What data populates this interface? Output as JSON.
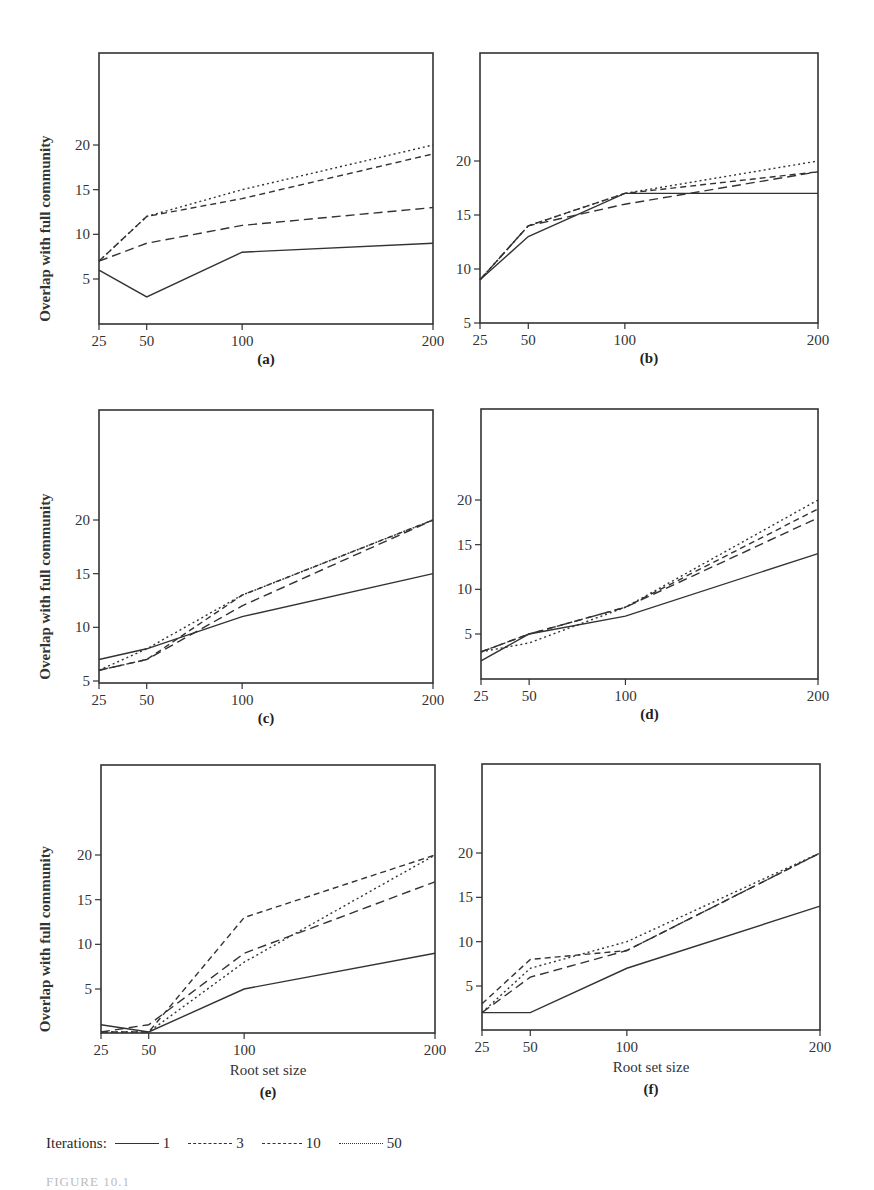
{
  "chart_data": [
    {
      "panel": "(a)",
      "type": "line",
      "x": [
        25,
        50,
        100,
        200
      ],
      "ylabel": "Overlap with full community",
      "xlabel": "",
      "yticks": [
        5,
        10,
        15,
        20
      ],
      "ylim": [
        0,
        30
      ],
      "series": [
        {
          "name": "1",
          "values": [
            6,
            3,
            8,
            9
          ]
        },
        {
          "name": "3",
          "values": [
            7,
            9,
            11,
            13
          ]
        },
        {
          "name": "10",
          "values": [
            7,
            12,
            14,
            19
          ]
        },
        {
          "name": "50",
          "values": [
            7,
            12,
            15,
            20
          ]
        }
      ]
    },
    {
      "panel": "(b)",
      "type": "line",
      "x": [
        25,
        50,
        100,
        200
      ],
      "ylabel": "",
      "xlabel": "",
      "yticks": [
        5,
        10,
        15,
        20
      ],
      "ylim": [
        5,
        30
      ],
      "series": [
        {
          "name": "1",
          "values": [
            9,
            13,
            17,
            17
          ]
        },
        {
          "name": "3",
          "values": [
            9,
            14,
            16,
            19
          ]
        },
        {
          "name": "10",
          "values": [
            9,
            14,
            17,
            19
          ]
        },
        {
          "name": "50",
          "values": [
            9,
            14,
            17,
            20
          ]
        }
      ]
    },
    {
      "panel": "(c)",
      "type": "line",
      "x": [
        25,
        50,
        100,
        200
      ],
      "ylabel": "Overlap with full community",
      "xlabel": "",
      "yticks": [
        5,
        10,
        15,
        20
      ],
      "ylim": [
        5,
        30
      ],
      "series": [
        {
          "name": "1",
          "values": [
            7,
            8,
            11,
            15
          ]
        },
        {
          "name": "3",
          "values": [
            6,
            7,
            12,
            20
          ]
        },
        {
          "name": "10",
          "values": [
            6,
            7,
            13,
            20
          ]
        },
        {
          "name": "50",
          "values": [
            6,
            8,
            13,
            20
          ]
        }
      ]
    },
    {
      "panel": "(d)",
      "type": "line",
      "x": [
        25,
        50,
        100,
        200
      ],
      "ylabel": "",
      "xlabel": "",
      "yticks": [
        5,
        10,
        15,
        20
      ],
      "ylim": [
        0,
        30
      ],
      "series": [
        {
          "name": "1",
          "values": [
            2,
            5,
            7,
            14
          ]
        },
        {
          "name": "3",
          "values": [
            3,
            5,
            8,
            18
          ]
        },
        {
          "name": "10",
          "values": [
            3,
            5,
            8,
            19
          ]
        },
        {
          "name": "50",
          "values": [
            3,
            4,
            8,
            20
          ]
        }
      ]
    },
    {
      "panel": "(e)",
      "type": "line",
      "x": [
        25,
        50,
        100,
        200
      ],
      "ylabel": "Overlap with full community",
      "xlabel": "Root set size",
      "yticks": [
        5,
        10,
        15,
        20
      ],
      "ylim": [
        0,
        30
      ],
      "series": [
        {
          "name": "1",
          "values": [
            1,
            0,
            5,
            9
          ]
        },
        {
          "name": "3",
          "values": [
            0,
            1,
            9,
            17
          ]
        },
        {
          "name": "10",
          "values": [
            0,
            0,
            13,
            20
          ]
        },
        {
          "name": "50",
          "values": [
            0,
            0,
            8,
            20
          ]
        }
      ]
    },
    {
      "panel": "(f)",
      "type": "line",
      "x": [
        25,
        50,
        100,
        200
      ],
      "ylabel": "",
      "xlabel": "Root set size",
      "yticks": [
        5,
        10,
        15,
        20
      ],
      "ylim": [
        0,
        30
      ],
      "series": [
        {
          "name": "1",
          "values": [
            2,
            2,
            7,
            14
          ]
        },
        {
          "name": "3",
          "values": [
            2,
            6,
            9,
            20
          ]
        },
        {
          "name": "10",
          "values": [
            3,
            8,
            9,
            20
          ]
        },
        {
          "name": "50",
          "values": [
            2,
            7,
            10,
            20
          ]
        }
      ]
    }
  ],
  "legend": {
    "title": "Iterations:",
    "items": [
      {
        "label": "1",
        "style": "solid"
      },
      {
        "label": "3",
        "style": "long-dash"
      },
      {
        "label": "10",
        "style": "dash"
      },
      {
        "label": "50",
        "style": "dotted"
      }
    ]
  },
  "caption_fragment": "FIGURE 10.1"
}
